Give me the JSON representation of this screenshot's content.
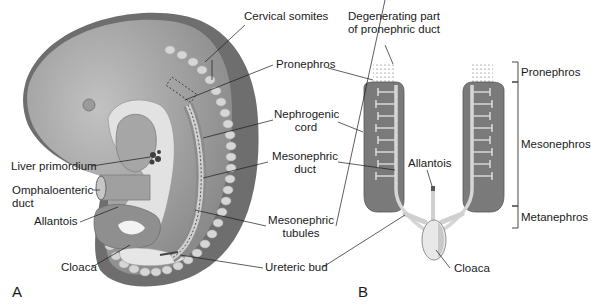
{
  "panels": {
    "a": "A",
    "b": "B"
  },
  "panel_a_labels": {
    "cervical_somites": "Cervical somites",
    "pronephros": "Pronephros",
    "nephrogenic_cord_1": "Nephrogenic",
    "nephrogenic_cord_2": "cord",
    "liver_primordium": "Liver primordium",
    "mesonephric_duct_1": "Mesonephric",
    "mesonephric_duct_2": "duct",
    "omphaloenteric_duct_1": "Omphaloenteric",
    "omphaloenteric_duct_2": "duct",
    "allantois": "Allantois",
    "mesonephric_tubules_1": "Mesonephric",
    "mesonephric_tubules_2": "tubules",
    "cloaca": "Cloaca",
    "ureteric_bud": "Ureteric bud"
  },
  "panel_b_labels": {
    "degenerating_1": "Degenerating part",
    "degenerating_2": "of pronephric duct",
    "allantois": "Allantois",
    "cloaca": "Cloaca"
  },
  "brackets": {
    "pronephros": "Pronephros",
    "mesonephros": "Mesonephros",
    "metanephros": "Metanephros"
  },
  "colors": {
    "embryo_body": "#a9a9a9",
    "embryo_dark": "#6e6e6e",
    "somite": "#d4d4d4",
    "light_structure": "#e4e4e4",
    "kidney": "#7a7a7a"
  }
}
